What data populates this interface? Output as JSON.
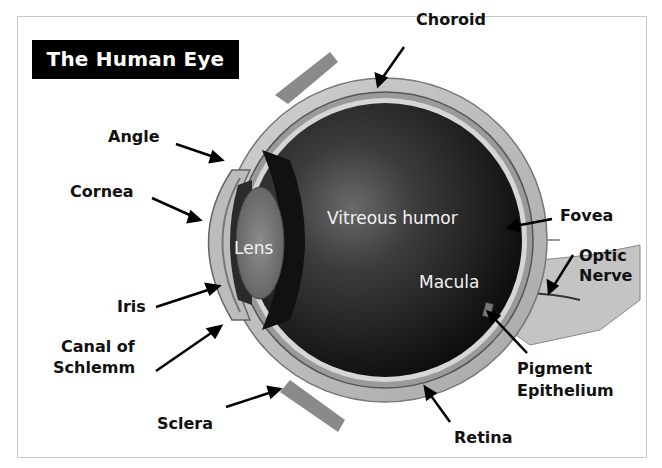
{
  "title": "The Human Eye",
  "labels": {
    "choroid": "Choroid",
    "angle": "Angle",
    "cornea": "Cornea",
    "fovea": "Fovea",
    "optic_nerve_line1": "Optic",
    "optic_nerve_line2": "Nerve",
    "iris": "Iris",
    "canal_line1": "Canal of",
    "canal_line2": "Schlemm",
    "pigment_line1": "Pigment",
    "pigment_line2": "Epithelium",
    "sclera": "Sclera",
    "retina": "Retina"
  },
  "inner_labels": {
    "vitreous": "Vitreous humor",
    "lens": "Lens",
    "macula": "Macula"
  },
  "colors": {
    "title_bg": "#000000",
    "title_fg": "#ffffff",
    "vitreous_dark": "#1a1a1a",
    "sclera_gray": "#bdbdbd"
  }
}
